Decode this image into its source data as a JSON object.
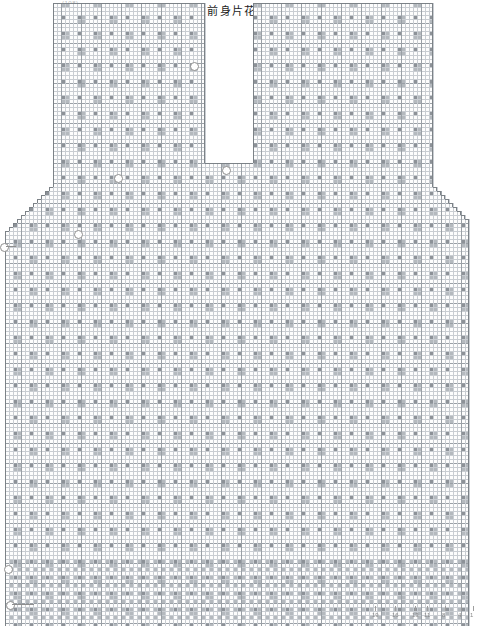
{
  "figure": {
    "label_prefix": "图",
    "label_number": "1",
    "caption": "前身片花样图解",
    "header_scrap": "(108)"
  },
  "colors": {
    "grid_minor": "#c9cdd2",
    "grid_major": "#9aa0a6",
    "symbol_fill": "#8d9298",
    "symbol_fill_light": "#b4b9be",
    "paper": "#ffffff",
    "annotation": "#8e8e8e",
    "text": "#1c1c1c"
  },
  "markers": [
    {
      "name": "hem-start-marker",
      "x": 6,
      "y": 601,
      "lead": 22,
      "cap": "",
      "cap_dx": 20,
      "cap_dy": 7
    },
    {
      "name": "hem-left-marker",
      "x": 4,
      "y": 565,
      "lead": 0,
      "cap": "",
      "cap_dx": 0,
      "cap_dy": 0
    },
    {
      "name": "waist-left-marker",
      "x": 0,
      "y": 243,
      "lead": 10,
      "cap": "",
      "cap_dx": 0,
      "cap_dy": 0
    },
    {
      "name": "neck-left-marker",
      "x": 190,
      "y": 62,
      "lead": 0,
      "cap": "",
      "cap_dx": 0,
      "cap_dy": 0
    },
    {
      "name": "neck-base-marker",
      "x": 222,
      "y": 166,
      "lead": 0,
      "cap": "",
      "cap_dx": 0,
      "cap_dy": 0
    },
    {
      "name": "armhole-left-marker",
      "x": 74,
      "y": 230,
      "lead": 0,
      "cap": "",
      "cap_dx": 0,
      "cap_dy": 0
    },
    {
      "name": "shoulder-left-marker",
      "x": 114,
      "y": 174,
      "lead": 0,
      "cap": "",
      "cap_dx": 0,
      "cap_dy": 0
    }
  ],
  "row_numbers": {
    "name": "bottom-row-numbers",
    "items": [
      {
        "label": "19",
        "x": 372
      },
      {
        "label": "16",
        "x": 392
      },
      {
        "label": "13",
        "x": 412
      },
      {
        "label": "11",
        "x": 424
      },
      {
        "label": "8",
        "x": 442
      },
      {
        "label": "4",
        "x": 458
      },
      {
        "label": "1",
        "x": 470
      }
    ],
    "y": 612
  },
  "chart_data": {
    "type": "heatmap",
    "subtitle": "",
    "xlabel": "",
    "ylabel": "",
    "grid": true,
    "legend_position": "none",
    "cell": 4,
    "cols": 119,
    "rows": 156,
    "origin": {
      "x": 1,
      "y": 3
    },
    "major_every": {
      "x": 5,
      "y": 5
    },
    "silhouette": {
      "description": "Front body outline: straight hem at bottom, straight side seams, stepped armhole decreases, shoulder blocks at top, and a deep V/slot neckline opening between the shoulders.",
      "body": {
        "x0": 2,
        "x1": 117,
        "y0": 59,
        "y1": 155
      },
      "upper_left_block": {
        "x0": 14,
        "x1": 51,
        "y0": 1,
        "y1": 45
      },
      "upper_right_block": {
        "x0": 64,
        "x1": 108,
        "y0": 1,
        "y1": 45
      },
      "neck_slot": {
        "x0": 52,
        "x1": 63,
        "y0": 1,
        "y1": 40
      },
      "armhole_steps_left": [
        [
          14,
          45
        ],
        [
          13,
          47
        ],
        [
          12,
          48
        ],
        [
          11,
          49
        ],
        [
          10,
          50
        ],
        [
          9,
          51
        ],
        [
          8,
          52
        ],
        [
          7,
          53
        ],
        [
          6,
          54
        ],
        [
          5,
          55
        ],
        [
          4,
          56
        ],
        [
          3,
          57
        ],
        [
          2,
          58
        ]
      ],
      "armhole_steps_right": [
        [
          108,
          45
        ],
        [
          109,
          47
        ],
        [
          110,
          48
        ],
        [
          111,
          49
        ],
        [
          112,
          50
        ],
        [
          113,
          51
        ],
        [
          114,
          52
        ],
        [
          115,
          53
        ],
        [
          116,
          54
        ],
        [
          117,
          55
        ]
      ],
      "hem_band": {
        "y0": 140,
        "y1": 155,
        "description": "denser ribbing rows at hem"
      }
    },
    "motif": {
      "description": "8x8 repeat: diagonal lattice forming diamonds with filled corner/center cells",
      "period_x": 8,
      "period_y": 8,
      "filled_offsets": [
        [
          0,
          0
        ],
        [
          1,
          0
        ],
        [
          4,
          4
        ],
        [
          5,
          4
        ],
        [
          0,
          1
        ],
        [
          1,
          1
        ],
        [
          4,
          5
        ],
        [
          5,
          5
        ]
      ]
    },
    "axis_ranges": {
      "x": [
        1,
        119
      ],
      "y": [
        1,
        156
      ]
    }
  }
}
